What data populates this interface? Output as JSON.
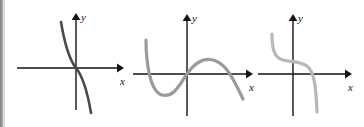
{
  "figure": {
    "width": 364,
    "height": 127,
    "background_color": "#ffffff",
    "edge_strip_color": "#8c8c8c",
    "axis_color": "#141414",
    "panel_count": 3
  },
  "panels": [
    {
      "id": "graph-1",
      "curve_color": "#4a4a4a",
      "curve_stroke_width": 2.6,
      "x_axis_label": "x",
      "y_axis_label": "y",
      "origin": {
        "x": 76,
        "y": 68
      },
      "x_axis": {
        "start_x": 17,
        "end_x": 122,
        "y": 68
      },
      "y_axis": {
        "x": 76,
        "start_y": 110,
        "end_y": 15
      },
      "curve_description": "decreasing cubic through origin, steep tails",
      "curve_path": "M 61 22 C 64 40, 68 58, 76 68 C 84 78, 88 95, 91 113"
    },
    {
      "id": "graph-2",
      "curve_color": "#9a9a9a",
      "curve_stroke_width": 3.2,
      "x_axis_label": "x",
      "y_axis_label": "y",
      "origin": {
        "x": 187,
        "y": 74
      },
      "x_axis": {
        "start_x": 133,
        "end_x": 253,
        "y": 74
      },
      "y_axis": {
        "x": 187,
        "start_y": 116,
        "end_y": 16
      },
      "curve_description": "negative leading cubic: falls from upper left, local minimum, rises through origin, local maximum, then falls",
      "curve_path": "M 146 40 C 146 62, 150 92, 162 95 C 174 98, 180 84, 187 74 C 196 61, 206 57, 216 61 C 226 65, 232 76, 243 99"
    },
    {
      "id": "graph-3",
      "curve_color": "#b8b8b8",
      "curve_stroke_width": 3.2,
      "x_axis_label": "x",
      "y_axis_label": "y",
      "origin": {
        "x": 293,
        "y": 74
      },
      "x_axis": {
        "start_x": 258,
        "end_x": 352,
        "y": 74
      },
      "y_axis": {
        "x": 293,
        "start_y": 116,
        "end_y": 16
      },
      "curve_description": "decreasing curve with flat inflection plateau above the x-axis, then steep drop",
      "curve_path": "M 272 34 C 272 48, 274 58, 283 60 C 292 62, 300 61, 307 66 C 314 71, 316 86, 317 112"
    }
  ]
}
